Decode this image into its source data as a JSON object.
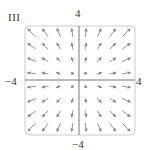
{
  "panel": {
    "label": "III"
  },
  "axes": {
    "x_min_label": "−4",
    "x_max_label": "4",
    "y_min_label": "−4",
    "y_max_label": "4"
  },
  "colors": {
    "arrow": "#8a8a8a",
    "axis": "#555555",
    "frame": "#cccccc"
  },
  "chart_data": {
    "type": "vector_field",
    "title": "III",
    "field": "F(x, y) = (x, y) (radial, pointing outward from origin)",
    "xlim": [
      -4,
      4
    ],
    "ylim": [
      -4,
      4
    ],
    "xticks": [
      "−4",
      "4"
    ],
    "yticks": [
      "−4",
      "4"
    ],
    "grid": false,
    "arrow_grid": {
      "x": [
        -3.5,
        -2.5,
        -1.5,
        -0.5,
        0.5,
        1.5,
        2.5,
        3.5
      ],
      "y": [
        -3.5,
        -2.5,
        -1.5,
        -0.5,
        0.5,
        1.5,
        2.5,
        3.5
      ]
    }
  }
}
